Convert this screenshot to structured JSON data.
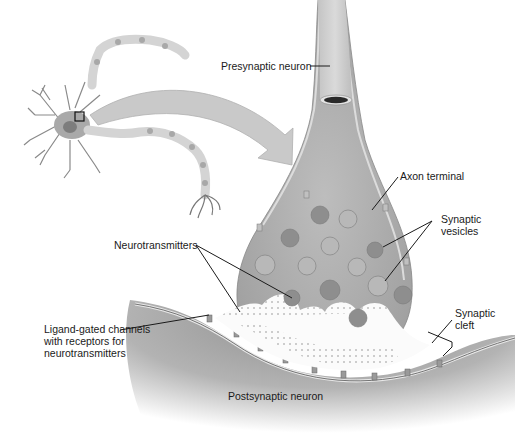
{
  "diagram": {
    "labels": {
      "presynaptic_neuron": "Presynaptic neuron",
      "axon_terminal": "Axon terminal",
      "synaptic_vesicles_1": "Synaptic",
      "synaptic_vesicles_2": "vesicles",
      "neurotransmitters": "Neurotransmitters",
      "synaptic_cleft_1": "Synaptic",
      "synaptic_cleft_2": "cleft",
      "ligand_1": "Ligand-gated channels",
      "ligand_2": "with receptors for",
      "ligand_3": "neurotransmitters",
      "postsynaptic_neuron": "Postsynaptic neuron"
    },
    "colors": {
      "background": "#ffffff",
      "neuron_fill": "#b4b4b4",
      "terminal_fill": "#a9a9a9",
      "postsynaptic_dark": "#9a9a9a",
      "membrane": "#d8d8d8",
      "leader_line": "#1a1a1a",
      "text": "#1a1a1a"
    }
  }
}
